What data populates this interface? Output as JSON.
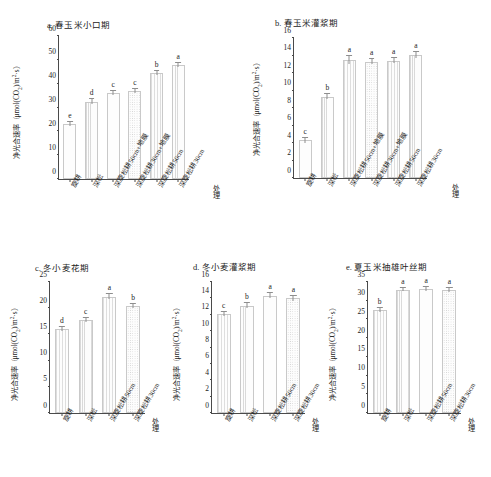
{
  "figure": {
    "y_axis_title": "净光合速率（μmol(CO2)/m2·s）",
    "y_axis_title_parts": {
      "main": "净光合速率（μmol(CO",
      "sub1": "2",
      "mid": ")/m",
      "sup1": "2",
      "tail": "·s）"
    },
    "x_axis_title": "处理"
  },
  "chart_data": [
    {
      "id": "a",
      "type": "bar",
      "title": "a. 春玉米小口期",
      "xlabel": "处理",
      "ylabel": "净光合速率（μmol(CO2)/m2·s）",
      "ylim": [
        0,
        60
      ],
      "yticks": [
        0,
        10,
        20,
        30,
        40,
        50,
        60
      ],
      "grid": false,
      "legend": "none",
      "categories": [
        "旋耕",
        "深松",
        "深旋松耕50cm+地膜",
        "深旋松耕30cm+地膜",
        "深旋松耕50cm",
        "深旋松耕30cm"
      ],
      "values": [
        23.0,
        32.5,
        36.0,
        37.0,
        44.5,
        48.0
      ],
      "errors": [
        0.9,
        0.9,
        0.8,
        0.8,
        0.9,
        0.8
      ],
      "annotations": [
        "e",
        "d",
        "c",
        "c",
        "b",
        "a"
      ]
    },
    {
      "id": "b",
      "type": "bar",
      "title": "b. 春玉米灌浆期",
      "xlabel": "处理",
      "ylabel": "净光合速率（μmol(CO2)/m2·s）",
      "ylim": [
        0,
        16
      ],
      "yticks": [
        0,
        2,
        4,
        6,
        8,
        10,
        12,
        14,
        16
      ],
      "grid": false,
      "legend": "none",
      "categories": [
        "旋耕",
        "深松",
        "深旋松耕50cm+地膜",
        "深旋松耕30cm+地膜",
        "深旋松耕50cm",
        "深旋松耕30cm"
      ],
      "values": [
        4.3,
        9.3,
        13.5,
        13.3,
        13.4,
        14.1
      ],
      "errors": [
        0.25,
        0.3,
        0.45,
        0.3,
        0.3,
        0.35
      ],
      "annotations": [
        "c",
        "b",
        "a",
        "a",
        "a",
        "a"
      ]
    },
    {
      "id": "c",
      "type": "bar",
      "title": "c. 冬小麦花期",
      "xlabel": "处理",
      "ylabel": "净光合速率（μmol(CO2)/m2·s）",
      "ylim": [
        0,
        25
      ],
      "yticks": [
        0,
        5,
        10,
        15,
        20,
        25
      ],
      "grid": false,
      "legend": "none",
      "categories": [
        "旋耕",
        "深松",
        "深旋松耕50cm",
        "深旋松耕30cm"
      ],
      "values": [
        16.0,
        17.8,
        22.2,
        20.4
      ],
      "errors": [
        0.4,
        0.4,
        0.45,
        0.4
      ],
      "annotations": [
        "d",
        "c",
        "a",
        "b"
      ]
    },
    {
      "id": "d",
      "type": "bar",
      "title": "d. 冬小麦灌浆期",
      "xlabel": "处理",
      "ylabel": "净光合速率（μmol(CO2)/m2·s）",
      "ylim": [
        0,
        16
      ],
      "yticks": [
        0,
        2,
        4,
        6,
        8,
        10,
        12,
        14,
        16
      ],
      "grid": false,
      "legend": "none",
      "categories": [
        "旋耕",
        "深松",
        "深旋松耕50cm",
        "深旋松耕30cm"
      ],
      "values": [
        12.1,
        13.1,
        14.3,
        14.0
      ],
      "errors": [
        0.25,
        0.3,
        0.3,
        0.3
      ],
      "annotations": [
        "c",
        "b",
        "a",
        "a"
      ]
    },
    {
      "id": "e",
      "type": "bar",
      "title": "e. 夏玉米抽雄叶丝期",
      "xlabel": "处理",
      "ylabel": "净光合速率（μmol(CO2)/m2·s）",
      "ylim": [
        0,
        35
      ],
      "yticks": [
        0,
        5,
        10,
        15,
        20,
        25,
        30,
        35
      ],
      "grid": false,
      "legend": "none",
      "categories": [
        "旋耕",
        "深松",
        "深旋松耕50cm",
        "深旋松耕30cm"
      ],
      "values": [
        27.5,
        33.0,
        33.2,
        32.8
      ],
      "errors": [
        0.5,
        0.5,
        0.5,
        0.5
      ],
      "annotations": [
        "b",
        "a",
        "a",
        "a"
      ]
    }
  ]
}
